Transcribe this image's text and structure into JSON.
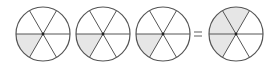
{
  "diagram": {
    "sectors_per_circle": 6,
    "colors": {
      "stroke": "#555555",
      "fill_shaded": "#e6e6e6",
      "fill_empty": "#ffffff",
      "center_dot": "#222222"
    },
    "circles": [
      {
        "id": "circle-1",
        "cx": 43,
        "cy": 34,
        "r": 27,
        "shaded_sectors": [
          3
        ]
      },
      {
        "id": "circle-2",
        "cx": 103,
        "cy": 34,
        "r": 27,
        "shaded_sectors": [
          3
        ]
      },
      {
        "id": "circle-3",
        "cx": 163,
        "cy": 34,
        "r": 27,
        "shaded_sectors": [
          3
        ]
      },
      {
        "id": "circle-4",
        "cx": 236,
        "cy": 34,
        "r": 27,
        "shaded_sectors": [
          1,
          2,
          3
        ]
      }
    ],
    "operator": {
      "symbol": "=",
      "x": 198,
      "y": 34
    }
  }
}
